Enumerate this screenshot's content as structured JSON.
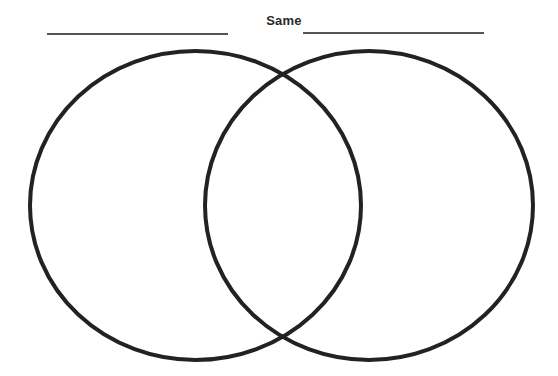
{
  "diagram": {
    "type": "venn",
    "title": "Same",
    "left_label_line": "",
    "right_label_line": "",
    "circles": [
      {
        "name": "left",
        "cx": 195.5,
        "cy": 205.5,
        "rx": 165.5,
        "ry": 154.5
      },
      {
        "name": "right",
        "cx": 369,
        "cy": 205.5,
        "rx": 164,
        "ry": 154.5
      }
    ],
    "stroke_color": "#222222",
    "stroke_width": 4
  }
}
